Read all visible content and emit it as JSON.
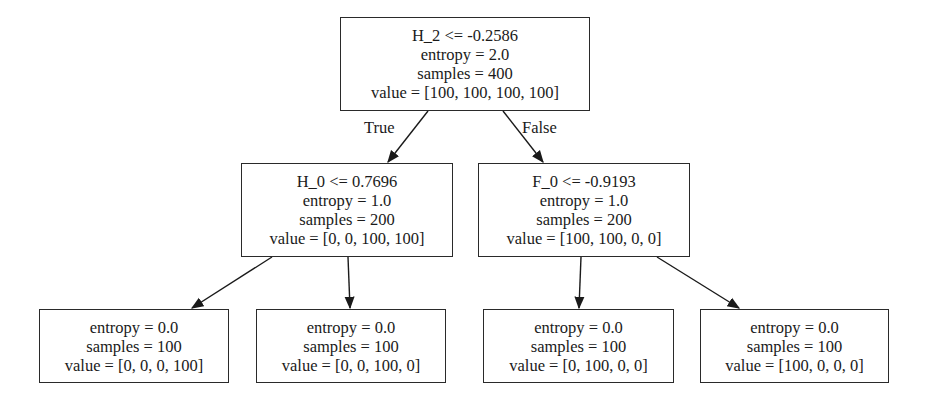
{
  "tree": {
    "root": {
      "condition": "H_2 <= -0.2586",
      "entropy": "entropy = 2.0",
      "samples": "samples = 400",
      "value": "value = [100, 100, 100, 100]"
    },
    "edge_labels": {
      "true": "True",
      "false": "False"
    },
    "left": {
      "condition": "H_0 <= 0.7696",
      "entropy": "entropy = 1.0",
      "samples": "samples = 200",
      "value": "value = [0, 0, 100, 100]"
    },
    "right": {
      "condition": "F_0 <= -0.9193",
      "entropy": "entropy = 1.0",
      "samples": "samples = 200",
      "value": "value = [100, 100, 0, 0]"
    },
    "leaves": [
      {
        "entropy": "entropy = 0.0",
        "samples": "samples = 100",
        "value": "value = [0, 0, 0, 100]"
      },
      {
        "entropy": "entropy = 0.0",
        "samples": "samples = 100",
        "value": "value = [0, 0, 100, 0]"
      },
      {
        "entropy": "entropy = 0.0",
        "samples": "samples = 100",
        "value": "value = [0, 100, 0, 0]"
      },
      {
        "entropy": "entropy = 0.0",
        "samples": "samples = 100",
        "value": "value = [100, 0, 0, 0]"
      }
    ]
  }
}
